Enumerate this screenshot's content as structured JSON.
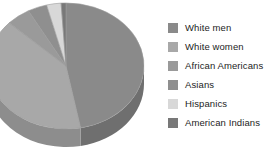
{
  "chart_data": {
    "type": "pie",
    "title": "",
    "subtitle": "",
    "xlabel": "",
    "ylabel": "",
    "grid": false,
    "legend_position": "right",
    "three_d": true,
    "start_angle_deg": 0,
    "direction": "clockwise",
    "categories": [
      "White men",
      "White women",
      "African Americans",
      "Asians",
      "Hispanics",
      "American Indians"
    ],
    "values": [
      47,
      40,
      5,
      4,
      3,
      1
    ],
    "units": "percent",
    "colors": [
      "#8a8a8a",
      "#a8a8a8",
      "#9a9a9a",
      "#8f8f8f",
      "#d8d8d8",
      "#787878"
    ],
    "side_colors": [
      "#6f6f6f",
      "#8d8d8d",
      "#7f7f7f",
      "#757575",
      "#b4b4b4",
      "#616161"
    ],
    "annotations": []
  },
  "legend": {
    "items": [
      {
        "label": "White men",
        "color": "#8a8a8a"
      },
      {
        "label": "White women",
        "color": "#a8a8a8"
      },
      {
        "label": "African Americans",
        "color": "#9a9a9a"
      },
      {
        "label": "Asians",
        "color": "#8f8f8f"
      },
      {
        "label": "Hispanics",
        "color": "#d8d8d8"
      },
      {
        "label": "American Indians",
        "color": "#787878"
      }
    ]
  },
  "canvas": {
    "background": "#ffffff",
    "width": 276,
    "height": 149
  }
}
